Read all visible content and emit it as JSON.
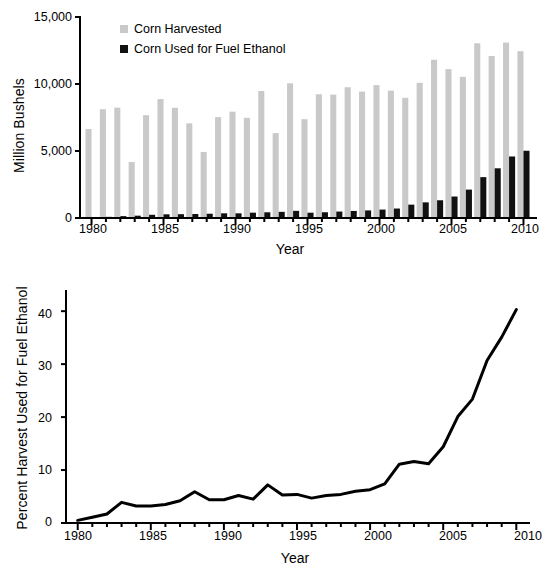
{
  "figure": {
    "background": "#ffffff",
    "panels": [
      "top-bar-chart",
      "bottom-line-chart"
    ]
  },
  "chart_data": [
    {
      "id": "corn-harvest-vs-ethanol",
      "type": "bar",
      "title": "",
      "subtitle": "",
      "xlabel": "Year",
      "ylabel": "Million Bushels",
      "xlim": [
        1979.2,
        2010.8
      ],
      "ylim": [
        0,
        15000
      ],
      "yticks": [
        0,
        5000,
        10000,
        15000
      ],
      "ytick_labels": [
        "0",
        "5,000",
        "10,000",
        "15,000"
      ],
      "xticks": [
        1980,
        1985,
        1990,
        1995,
        2000,
        2005,
        2010
      ],
      "xtick_labels": [
        "1980",
        "1985",
        "1990",
        "1995",
        "2000",
        "2005",
        "2010"
      ],
      "minor_xticks_every": 1,
      "grid": false,
      "legend_position": "top-left",
      "categories": [
        1980,
        1981,
        1982,
        1983,
        1984,
        1985,
        1986,
        1987,
        1988,
        1989,
        1990,
        1991,
        1992,
        1993,
        1994,
        1995,
        1996,
        1997,
        1998,
        1999,
        2000,
        2001,
        2002,
        2003,
        2004,
        2005,
        2006,
        2007,
        2008,
        2009,
        2010
      ],
      "series": [
        {
          "name": "Corn Harvested",
          "color": "#c9c9c9",
          "values": [
            6639,
            8119,
            8235,
            4175,
            7674,
            8875,
            8226,
            7064,
            4929,
            7525,
            7934,
            7475,
            9477,
            6336,
            10051,
            7374,
            9233,
            9207,
            9759,
            9431,
            9915,
            9503,
            8967,
            10089,
            11806,
            11112,
            10535,
            13038,
            12092,
            13092,
            12447
          ]
        },
        {
          "name": "Corn Used for Fuel Ethanol",
          "color": "#111111",
          "values": [
            35,
            86,
            140,
            173,
            242,
            277,
            285,
            296,
            319,
            349,
            349,
            398,
            426,
            458,
            533,
            396,
            429,
            481,
            526,
            566,
            628,
            707,
            996,
            1168,
            1323,
            1603,
            2119,
            3049,
            3709,
            4591,
            5019
          ]
        }
      ]
    },
    {
      "id": "percent-harvest-used-for-fuel-ethanol",
      "type": "line",
      "title": "",
      "xlabel": "Year",
      "ylabel": "Percent Harvest Used for Fuel Ethanol",
      "xlim": [
        1979.2,
        2010.8
      ],
      "ylim": [
        0,
        44
      ],
      "yticks": [
        0,
        10,
        20,
        30,
        40
      ],
      "ytick_labels": [
        "0",
        "10",
        "20",
        "30",
        "40"
      ],
      "xticks": [
        1980,
        1985,
        1990,
        1995,
        2000,
        2005,
        2010
      ],
      "xtick_labels": [
        "1980",
        "1985",
        "1990",
        "1995",
        "2000",
        "2005",
        "2010"
      ],
      "minor_xticks_every": 1,
      "grid": false,
      "legend_position": "none",
      "line_color": "#000000",
      "line_width": 3,
      "x": [
        1980,
        1981,
        1982,
        1983,
        1984,
        1985,
        1986,
        1987,
        1988,
        1989,
        1990,
        1991,
        1992,
        1993,
        1994,
        1995,
        1996,
        1997,
        1998,
        1999,
        2000,
        2001,
        2002,
        2003,
        2004,
        2005,
        2006,
        2007,
        2008,
        2009,
        2010
      ],
      "values": [
        0.5,
        1.1,
        1.7,
        3.9,
        3.2,
        3.2,
        3.5,
        4.2,
        5.9,
        4.4,
        4.4,
        5.2,
        4.5,
        7.2,
        5.3,
        5.4,
        4.7,
        5.2,
        5.4,
        6.0,
        6.3,
        7.4,
        11.1,
        11.6,
        11.2,
        14.4,
        20.1,
        23.4,
        30.7,
        35.1,
        40.3
      ]
    }
  ],
  "top_panel": {
    "ylabel": "Million Bushels",
    "xlabel": "Year",
    "ytick_labels": [
      "15,000",
      "10,000",
      "5,000",
      "0"
    ],
    "xtick_labels": [
      "1980",
      "1985",
      "1990",
      "1995",
      "2000",
      "2005",
      "2010"
    ],
    "legend": [
      {
        "label": "Corn Harvested",
        "color": "#c9c9c9",
        "swatch": "gray-square-swatch"
      },
      {
        "label": "Corn Used for Fuel Ethanol",
        "color": "#111111",
        "swatch": "black-square-swatch"
      }
    ]
  },
  "bottom_panel": {
    "ylabel": "Percent Harvest Used for Fuel Ethanol",
    "xlabel": "Year",
    "ytick_labels": [
      "40",
      "30",
      "20",
      "10",
      "0"
    ],
    "xtick_labels": [
      "1980",
      "1985",
      "1990",
      "1995",
      "2000",
      "2005",
      "2010"
    ]
  },
  "colors": {
    "harvested": "#c9c9c9",
    "ethanol": "#111111",
    "axis": "#000000",
    "background": "#ffffff"
  }
}
